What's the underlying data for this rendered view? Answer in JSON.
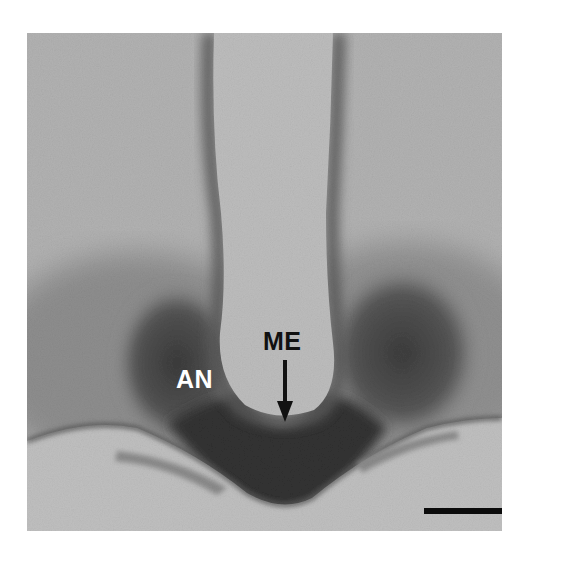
{
  "figure": {
    "type": "histology-micrograph",
    "mode": "grayscale",
    "labels": [
      {
        "id": "an",
        "text": "AN",
        "color": "#ffffff"
      },
      {
        "id": "me",
        "text": "ME",
        "color": "#111111"
      }
    ],
    "arrow": {
      "points_to": "ME",
      "direction": "down",
      "color": "#111111"
    },
    "scale_bar": {
      "color": "#0b0b0b",
      "label": ""
    }
  },
  "colors": {
    "page_background": "#ffffff",
    "tissue_light": "#b4b4b4",
    "ventricle_lumen": "#bdbdbd",
    "stain_dark": "#3a3a3a",
    "stain_mid": "#6e6e6e",
    "below_tissue": "#c2c2c2"
  }
}
